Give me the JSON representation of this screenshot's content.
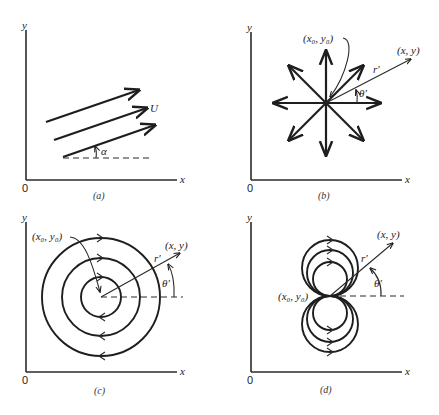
{
  "figure": {
    "panels": [
      {
        "id": "a",
        "caption": "(a)",
        "x_label": "x",
        "y_label": "y",
        "origin_label": "0",
        "flow_type": "uniform flow",
        "velocity_label": "U",
        "angle_label": "α"
      },
      {
        "id": "b",
        "caption": "(b)",
        "x_label": "x",
        "y_label": "y",
        "origin_label": "0",
        "flow_type": "source",
        "center_label": "(x₀, y₀)",
        "point_label": "(x, y)",
        "radius_label": "r′",
        "angle_label": "θ′"
      },
      {
        "id": "c",
        "caption": "(c)",
        "x_label": "x",
        "y_label": "y",
        "origin_label": "0",
        "flow_type": "vortex",
        "center_label": "(x₀, y₀)",
        "point_label": "(x, y)",
        "radius_label": "r′",
        "angle_label": "θ′"
      },
      {
        "id": "d",
        "caption": "(d)",
        "x_label": "x",
        "y_label": "y",
        "origin_label": "0",
        "flow_type": "doublet",
        "center_label": "(x₀, y₀)",
        "point_label": "(x, y)",
        "radius_label": "r′",
        "angle_label": "θ′"
      }
    ]
  }
}
